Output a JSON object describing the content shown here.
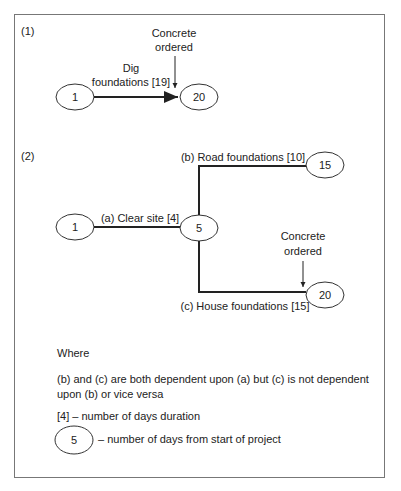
{
  "diagram1": {
    "label": "(1)",
    "node_start": "1",
    "node_end": "20",
    "activity_line1": "Dig",
    "activity_line2": "foundations [19]",
    "note_line1": "Concrete",
    "note_line2": "ordered"
  },
  "diagram2": {
    "label": "(2)",
    "node_start": "1",
    "node_mid": "5",
    "node_top": "15",
    "node_bottom": "20",
    "activity_a": "(a) Clear site [4]",
    "activity_b": "(b) Road foundations [10]",
    "activity_c": "(c) House foundations [15]",
    "note_line1": "Concrete",
    "note_line2": "ordered"
  },
  "legend": {
    "where": "Where",
    "dependency_line1": "(b) and (c) are both dependent upon (a) but (c) is not dependent",
    "dependency_line2": "upon (b) or vice versa",
    "duration": "[4] – number of days duration",
    "node_example": "5",
    "node_desc": "– number of days from start of project"
  }
}
